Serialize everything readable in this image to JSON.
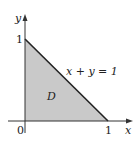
{
  "diagram": {
    "type": "region-plot",
    "axes": {
      "x_label": "x",
      "y_label": "y",
      "origin_label": "0",
      "x_tick_label": "1",
      "y_tick_label": "1"
    },
    "region": {
      "label": "D",
      "vertices": [
        [
          0,
          0
        ],
        [
          1,
          0
        ],
        [
          0,
          1
        ]
      ],
      "fill_color": "#c9c9c9"
    },
    "boundary": {
      "equation_label": "x + y = 1"
    },
    "colors": {
      "line": "#222222",
      "fill": "#c9c9c9"
    }
  }
}
